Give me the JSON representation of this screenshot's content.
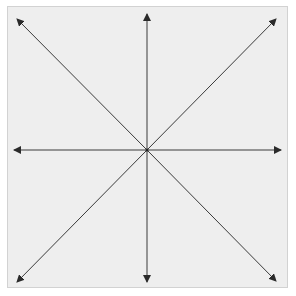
{
  "diagram": {
    "type": "radial-arrows",
    "background": "#eeeeee",
    "border_color": "#d2d2d2",
    "line_color": "#3a3a3a",
    "center": {
      "x": 147,
      "y": 150
    },
    "arrows": [
      {
        "direction": "north",
        "x": 147,
        "y": 14
      },
      {
        "direction": "south",
        "x": 147,
        "y": 282
      },
      {
        "direction": "west",
        "x": 14,
        "y": 150
      },
      {
        "direction": "east",
        "x": 281,
        "y": 150
      },
      {
        "direction": "north-west",
        "x": 17,
        "y": 19
      },
      {
        "direction": "north-east",
        "x": 276,
        "y": 19
      },
      {
        "direction": "south-west",
        "x": 17,
        "y": 282
      },
      {
        "direction": "south-east",
        "x": 276,
        "y": 281
      }
    ]
  }
}
